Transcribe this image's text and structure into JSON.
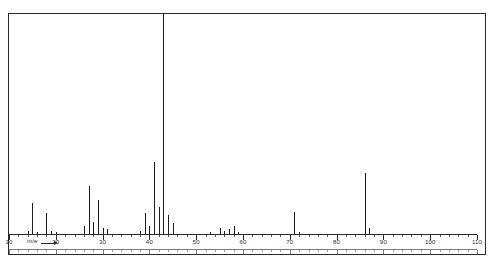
{
  "figure": {
    "background_color": "#ffffff",
    "frame_color": "#2b2b2b",
    "stick_color": "#1c1c1c"
  },
  "axis": {
    "title": "m/e",
    "arrow_icon": "right-arrow-icon",
    "tick_labels": [
      "10",
      "20",
      "30",
      "40",
      "50",
      "60",
      "70",
      "80",
      "90",
      "100",
      "110"
    ],
    "tick_values": [
      10,
      20,
      30,
      40,
      50,
      60,
      70,
      80,
      90,
      100,
      110
    ],
    "minor_tick_step": 2
  },
  "chart_data": {
    "type": "bar",
    "title": "",
    "subtitle": "",
    "xlabel": "m/e",
    "ylabel": "",
    "xlim": [
      10,
      110
    ],
    "ylim": [
      0,
      100
    ],
    "grid": false,
    "legend": "none",
    "categories": [
      14,
      15,
      16,
      18,
      19,
      20,
      26,
      27,
      28,
      29,
      30,
      31,
      38,
      39,
      40,
      41,
      42,
      43,
      44,
      45,
      53,
      55,
      56,
      57,
      58,
      59,
      71,
      72,
      86,
      87
    ],
    "values": [
      2.0,
      14.5,
      1.5,
      10.0,
      2.0,
      1.2,
      4.0,
      22.0,
      6.0,
      16.0,
      3.0,
      2.5,
      2.0,
      10.0,
      4.0,
      33.0,
      12.5,
      100.0,
      9.0,
      5.5,
      1.5,
      3.0,
      2.0,
      2.5,
      4.0,
      1.5,
      10.5,
      1.5,
      28.0,
      3.0
    ],
    "base_peak_mz": 43,
    "base_peak_intensity": 100,
    "molecular_ion_mz": 86,
    "molecular_ion_intensity": 28
  }
}
